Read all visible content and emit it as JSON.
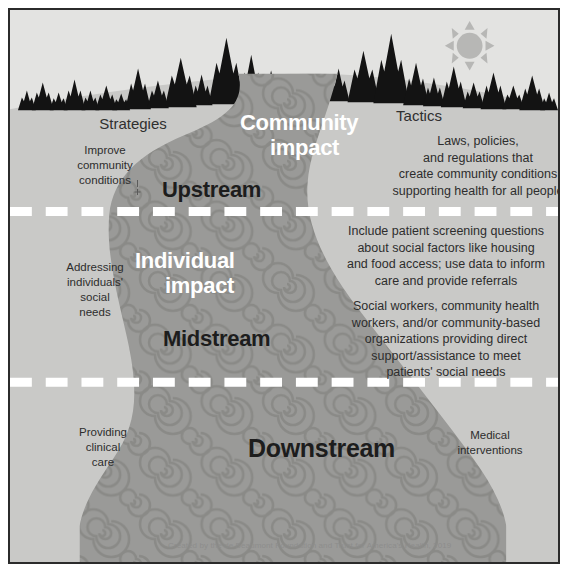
{
  "diagram": {
    "credit": "Created by the de Beaumont Foundation and Trust for America's Health, 2019",
    "colors": {
      "sky": "#e3e3e1",
      "land": "#c9c9c7",
      "river": "#9a9a98",
      "river_swirl": "#8a8a88",
      "tree_silhouette": "#141414",
      "sun": "#b4b4b2",
      "divider": "#ffffff",
      "border": "#2b2b2b",
      "impact_text": "#ffffff",
      "stream_text": "#1d1d1d",
      "body_text": "#2d2d2d"
    },
    "columns": {
      "left_header": "Strategies",
      "right_header": "Tactics"
    },
    "levels": [
      {
        "id": "upstream",
        "stream_label": "Upstream",
        "impact_label": "Community\nimpact",
        "impact_line1": "Community",
        "impact_line2": "impact",
        "strategy": "Improve\ncommunity\nconditions",
        "tactic": "Laws, policies,\nand regulations that\ncreate community conditions\nsupporting health for all people"
      },
      {
        "id": "midstream",
        "stream_label": "Midstream",
        "impact_line1": "Individual",
        "impact_line2": "impact",
        "strategy": "Addressing\nindividuals'\nsocial\nneeds",
        "tactic_upper": "Include patient screening questions\nabout social factors like housing\nand food access; use data to inform\ncare and provide referrals",
        "tactic_lower": "Social workers, community health\nworkers, and/or community-based\norganizations providing direct\nsupport/assistance to meet\npatients' social needs"
      },
      {
        "id": "downstream",
        "stream_label": "Downstream",
        "strategy": "Providing\nclinical\ncare",
        "tactic": "Medical\ninterventions"
      }
    ],
    "icons": {
      "sun": "sun-icon",
      "trees": "pine-tree-silhouette-icon",
      "river": "river-icon",
      "divider": "dashed-divider-icon"
    }
  }
}
